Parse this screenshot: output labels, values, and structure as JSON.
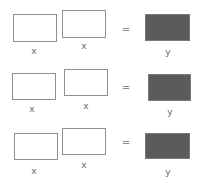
{
  "diagram": {
    "rows": [
      {
        "input1": {
          "label": "x"
        },
        "input2": {
          "label": "x"
        },
        "operator": "=",
        "output": {
          "label": "y"
        }
      },
      {
        "input1": {
          "label": "x"
        },
        "input2": {
          "label": "x"
        },
        "operator": "=",
        "output": {
          "label": "y"
        }
      },
      {
        "input1": {
          "label": "x"
        },
        "input2": {
          "label": "x"
        },
        "operator": "=",
        "output": {
          "label": "y"
        }
      }
    ],
    "colors": {
      "input_fill": "#ffffff",
      "input_border": "#8f8f8f",
      "output_fill": "#5b5b5b",
      "label_text": "#6a6a6a"
    }
  }
}
